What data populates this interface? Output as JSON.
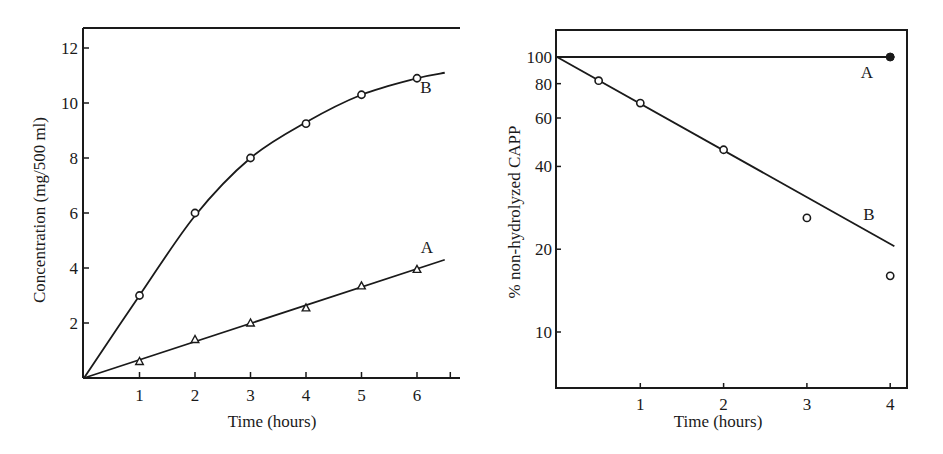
{
  "chart_data": [
    {
      "id": "left",
      "type": "line",
      "title": "",
      "xlabel": "Time (hours)",
      "ylabel": "Concentration (mg/500 ml)",
      "xlim": [
        0,
        6.6
      ],
      "ylim": [
        0,
        12.6
      ],
      "xticks": [
        1,
        2,
        3,
        4,
        5,
        6
      ],
      "yticks": [
        2,
        4,
        6,
        8,
        10,
        12
      ],
      "grid": false,
      "legend": "inline labels at curve ends",
      "series": [
        {
          "name": "A",
          "marker": "triangle",
          "points": [
            [
              1,
              0.6
            ],
            [
              2,
              1.4
            ],
            [
              3,
              2.0
            ],
            [
              4,
              2.55
            ],
            [
              5,
              3.35
            ],
            [
              6,
              3.95
            ]
          ],
          "fit": [
            [
              0,
              0
            ],
            [
              6.5,
              4.3
            ]
          ]
        },
        {
          "name": "B",
          "marker": "circle",
          "points": [
            [
              1,
              3.0
            ],
            [
              2,
              6.0
            ],
            [
              3,
              8.0
            ],
            [
              4,
              9.25
            ],
            [
              5,
              10.3
            ],
            [
              6,
              10.9
            ]
          ],
          "fit": [
            [
              0,
              0
            ],
            [
              1,
              3.0
            ],
            [
              2,
              5.9
            ],
            [
              3,
              8.0
            ],
            [
              4,
              9.3
            ],
            [
              5,
              10.3
            ],
            [
              6,
              10.9
            ],
            [
              6.5,
              11.1
            ]
          ]
        }
      ]
    },
    {
      "id": "right",
      "type": "line",
      "title": "",
      "xlabel": "Time (hours)",
      "ylabel": "% non-hydrolyzed CAPP",
      "yscale": "log",
      "xlim": [
        0,
        4.2
      ],
      "ylim": [
        6,
        160
      ],
      "xticks": [
        1,
        2,
        3,
        4
      ],
      "yticks": [
        10,
        20,
        40,
        60,
        80,
        100
      ],
      "grid": false,
      "legend": "inline labels near curves",
      "series": [
        {
          "name": "A",
          "marker": "filled-star",
          "points": [
            [
              4,
              100
            ]
          ],
          "fit": [
            [
              0,
              100
            ],
            [
              4.05,
              100
            ]
          ]
        },
        {
          "name": "B",
          "marker": "circle",
          "points": [
            [
              0.5,
              82
            ],
            [
              1,
              68
            ],
            [
              2,
              46
            ],
            [
              3,
              26
            ],
            [
              4,
              16
            ]
          ],
          "fit": [
            [
              0,
              100
            ],
            [
              4.05,
              20.5
            ]
          ]
        }
      ]
    }
  ],
  "labels": {
    "left_xlabel": "Time (hours)",
    "left_ylabel": "Concentration (mg/500 ml)",
    "right_xlabel": "Time (hours)",
    "right_ylabel": "% non-hydrolyzed CAPP"
  }
}
